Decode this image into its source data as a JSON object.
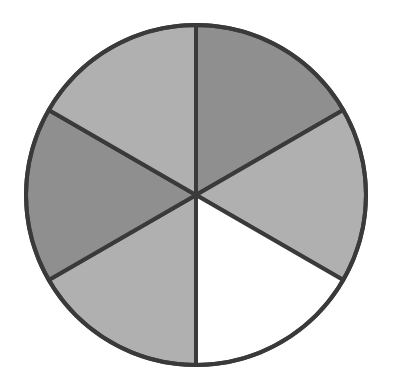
{
  "diagram": {
    "type": "fraction-circle",
    "center": [
      196,
      195
    ],
    "radius": 170,
    "outline_color": "#3a3a3a",
    "outline_width": 4,
    "sectors": [
      {
        "index": 0,
        "position": "top-right",
        "start_deg": 0,
        "end_deg": 60,
        "fill": "#8f8f8f",
        "shade": "dark"
      },
      {
        "index": 1,
        "position": "right",
        "start_deg": 60,
        "end_deg": 120,
        "fill": "#b0b0b0",
        "shade": "light"
      },
      {
        "index": 2,
        "position": "bottom-right",
        "start_deg": 120,
        "end_deg": 180,
        "fill": "#ffffff",
        "shade": "unshaded"
      },
      {
        "index": 3,
        "position": "bottom-left",
        "start_deg": 180,
        "end_deg": 240,
        "fill": "#b0b0b0",
        "shade": "light"
      },
      {
        "index": 4,
        "position": "left",
        "start_deg": 240,
        "end_deg": 300,
        "fill": "#8f8f8f",
        "shade": "dark"
      },
      {
        "index": 5,
        "position": "top-left",
        "start_deg": 300,
        "end_deg": 360,
        "fill": "#b0b0b0",
        "shade": "light"
      }
    ],
    "total_parts": 6,
    "shaded_parts": 5
  }
}
